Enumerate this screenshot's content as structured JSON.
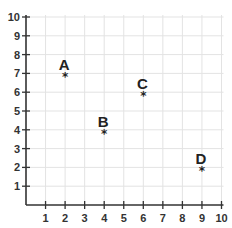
{
  "chart_data": {
    "type": "scatter",
    "title": "",
    "xlabel": "",
    "ylabel": "",
    "xlim": [
      0,
      10
    ],
    "ylim": [
      0,
      10
    ],
    "grid": true,
    "legend": null,
    "x_ticks": [
      "1",
      "2",
      "3",
      "4",
      "5",
      "6",
      "7",
      "8",
      "9",
      "10"
    ],
    "y_ticks": [
      "1",
      "2",
      "3",
      "4",
      "5",
      "6",
      "7",
      "8",
      "9",
      "10"
    ],
    "marker": "*",
    "points": [
      {
        "label": "A",
        "x": 2,
        "y": 7
      },
      {
        "label": "B",
        "x": 4,
        "y": 4
      },
      {
        "label": "C",
        "x": 6,
        "y": 6
      },
      {
        "label": "D",
        "x": 9,
        "y": 2
      }
    ]
  },
  "colors": {
    "axis": "#333333",
    "grid": "#e3e3e3",
    "text": "#222222"
  }
}
